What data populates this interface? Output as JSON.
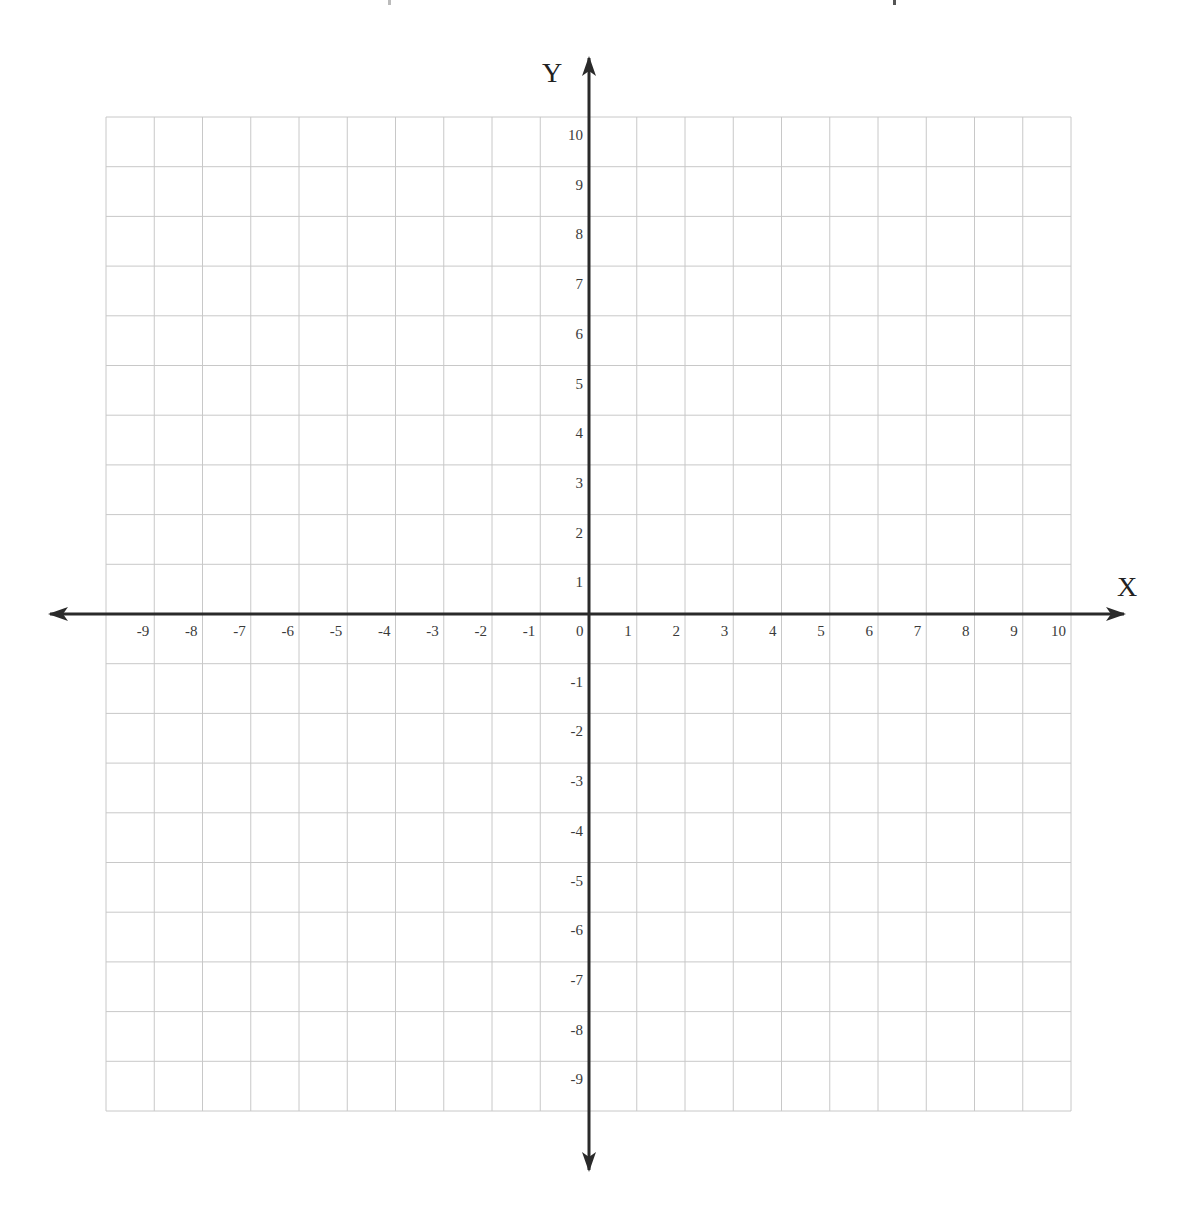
{
  "plane": {
    "x_axis_label": "X",
    "y_axis_label": "Y",
    "x_range": [
      -10,
      10
    ],
    "y_range": [
      -10,
      10
    ],
    "origin_label": "0",
    "x_tick_labels": [
      "-9",
      "-8",
      "-7",
      "-6",
      "-5",
      "-4",
      "-3",
      "-2",
      "-1",
      "0",
      "1",
      "2",
      "3",
      "4",
      "5",
      "6",
      "7",
      "8",
      "9",
      "10"
    ],
    "y_tick_labels": [
      "10",
      "9",
      "8",
      "7",
      "6",
      "5",
      "4",
      "3",
      "2",
      "1",
      "-1",
      "-2",
      "-3",
      "-4",
      "-5",
      "-6",
      "-7",
      "-8",
      "-9"
    ],
    "colors": {
      "grid": "#c8c8c8",
      "axis": "#2a2a2a",
      "label": "#3a3a3a"
    }
  },
  "chart_data": {
    "type": "scatter",
    "title": "",
    "xlabel": "X",
    "ylabel": "Y",
    "xlim": [
      -10,
      10
    ],
    "ylim": [
      -10,
      10
    ],
    "grid": true,
    "x_ticks": [
      -9,
      -8,
      -7,
      -6,
      -5,
      -4,
      -3,
      -2,
      -1,
      0,
      1,
      2,
      3,
      4,
      5,
      6,
      7,
      8,
      9,
      10
    ],
    "y_ticks": [
      10,
      9,
      8,
      7,
      6,
      5,
      4,
      3,
      2,
      1,
      -1,
      -2,
      -3,
      -4,
      -5,
      -6,
      -7,
      -8,
      -9
    ],
    "series": []
  }
}
